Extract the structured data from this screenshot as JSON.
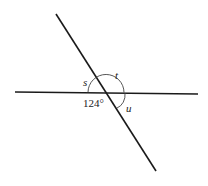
{
  "diagram": {
    "type": "intersecting-lines-angles",
    "angle_labels": {
      "s": "s",
      "t": "t",
      "u": "u"
    },
    "given_angle": "124°",
    "colors": {
      "line": "#1a1a1a",
      "arc": "#444444",
      "background": "#ffffff"
    }
  }
}
